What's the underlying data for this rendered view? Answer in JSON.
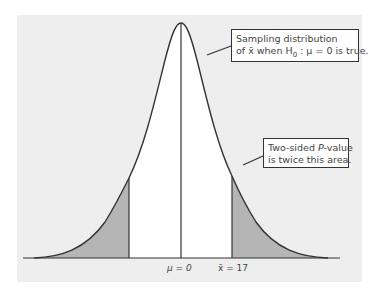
{
  "diagram": {
    "type": "normal-distribution-two-sided-p-value",
    "colors": {
      "background_panel": "#eeeeee",
      "curve": "#333333",
      "center_fill": "#ffffff",
      "tail_fill": "#b5b5b5"
    },
    "callouts": {
      "sampling": {
        "line1": "Sampling distribution",
        "line2_prefix": "of ",
        "line2_xbar": "x̄",
        "line2_mid": " when H",
        "line2_sub": "0",
        "line2_suffix": " : μ = 0 is true."
      },
      "pvalue": {
        "line1_prefix": "Two-sided ",
        "line1_p": "P",
        "line1_suffix": "-value",
        "line2": "is twice this area."
      }
    },
    "axis_labels": {
      "mu": "μ = 0",
      "xbar": "x̄ = 17"
    }
  }
}
